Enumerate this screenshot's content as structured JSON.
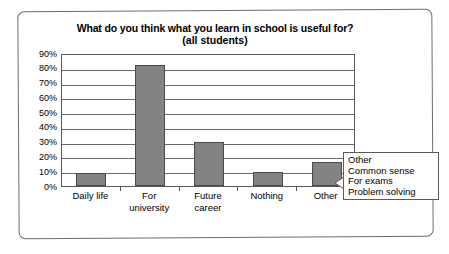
{
  "chart_data": {
    "type": "bar",
    "title": "What do you think what you learn in school is useful for?",
    "subtitle": "(all students)",
    "xlabel": "",
    "ylabel": "",
    "categories": [
      "Daily life",
      "For university",
      "Future career",
      "Nothing",
      "Other"
    ],
    "category_lines": [
      [
        "Daily life"
      ],
      [
        "For",
        "university"
      ],
      [
        "Future",
        "career"
      ],
      [
        "Nothing"
      ],
      [
        "Other"
      ]
    ],
    "values": [
      9,
      82,
      30,
      9.5,
      16
    ],
    "ylim": [
      0,
      90
    ],
    "ytick_labels": [
      "90%",
      "80%",
      "70%",
      "60%",
      "50%",
      "40%",
      "30%",
      "20%",
      "10%",
      "0%"
    ],
    "ytick_values": [
      90,
      80,
      70,
      60,
      50,
      40,
      30,
      20,
      10,
      0
    ],
    "grid": "horizontal",
    "legend": "none",
    "bar_color": "#838383",
    "bar_border_color": "#4a4a4a"
  },
  "callout": {
    "target_category": "Other",
    "lines": [
      "Other",
      "Common sense",
      "For exams",
      "Problem solving"
    ]
  }
}
